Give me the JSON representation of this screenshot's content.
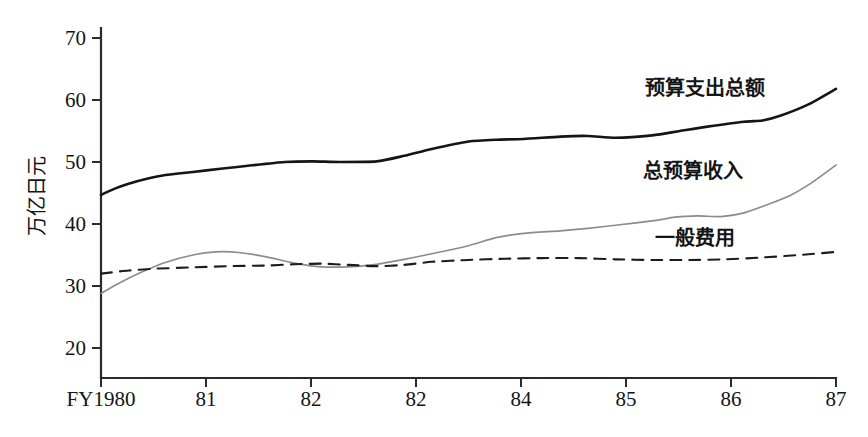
{
  "chart_data": {
    "type": "line",
    "title": "",
    "subtitle": "",
    "xlabel": "",
    "ylabel": "万亿日元",
    "ylim": [
      15,
      70
    ],
    "xlim": [
      1980,
      1987
    ],
    "grid": false,
    "legend_position": "inline-right",
    "x_tick_labels": [
      "FY1980",
      "81",
      "82",
      "82",
      "84",
      "85",
      "86",
      "87"
    ],
    "y_tick_labels": [
      "70",
      "60",
      "50",
      "40",
      "30",
      "20"
    ],
    "y_ticks": [
      70,
      60,
      50,
      40,
      30,
      20
    ],
    "x": [
      1980,
      1981,
      1982,
      1983,
      1984,
      1985,
      1986,
      1987
    ],
    "series": [
      {
        "name": "预算支出总额",
        "style": "solid",
        "color": "#151515",
        "width": 2.6,
        "values": [
          44.7,
          48.0,
          50.0,
          51.5,
          54.0,
          54.2,
          56.5,
          61.8
        ],
        "points": [
          [
            1980.0,
            44.7
          ],
          [
            1980.15,
            45.7
          ],
          [
            1980.3,
            46.5
          ],
          [
            1980.5,
            47.3
          ],
          [
            1980.7,
            47.9
          ],
          [
            1981.0,
            48.4
          ],
          [
            1981.3,
            48.9
          ],
          [
            1981.6,
            49.4
          ],
          [
            1982.0,
            50.0
          ],
          [
            1982.3,
            50.1
          ],
          [
            1982.6,
            50.0
          ],
          [
            1983.0,
            50.1
          ],
          [
            1983.3,
            51.0
          ],
          [
            1983.6,
            52.1
          ],
          [
            1984.0,
            53.3
          ],
          [
            1984.3,
            53.6
          ],
          [
            1984.6,
            53.7
          ],
          [
            1985.0,
            54.1
          ],
          [
            1985.3,
            54.2
          ],
          [
            1985.6,
            53.9
          ],
          [
            1986.0,
            54.3
          ],
          [
            1986.3,
            55.0
          ],
          [
            1986.6,
            55.7
          ],
          [
            1987.0,
            56.5
          ],
          [
            1987.2,
            56.7
          ],
          [
            1987.4,
            57.5
          ],
          [
            1987.7,
            59.3
          ],
          [
            1988.0,
            61.8
          ]
        ]
      },
      {
        "name": "总预算收入",
        "style": "solid",
        "color": "#8c8c8c",
        "width": 1.7,
        "values": [
          28.8,
          35.5,
          33.2,
          35.5,
          38.5,
          40.5,
          41.5,
          49.5
        ],
        "points": [
          [
            1980.0,
            28.8
          ],
          [
            1980.2,
            30.5
          ],
          [
            1980.45,
            32.3
          ],
          [
            1980.7,
            33.8
          ],
          [
            1981.0,
            35.0
          ],
          [
            1981.25,
            35.5
          ],
          [
            1981.5,
            35.4
          ],
          [
            1981.8,
            34.7
          ],
          [
            1982.1,
            33.7
          ],
          [
            1982.4,
            33.1
          ],
          [
            1982.7,
            33.1
          ],
          [
            1983.0,
            33.5
          ],
          [
            1983.3,
            34.3
          ],
          [
            1983.6,
            35.2
          ],
          [
            1984.0,
            36.5
          ],
          [
            1984.3,
            37.8
          ],
          [
            1984.6,
            38.5
          ],
          [
            1985.0,
            38.9
          ],
          [
            1985.3,
            39.3
          ],
          [
            1985.6,
            39.8
          ],
          [
            1986.0,
            40.5
          ],
          [
            1986.25,
            41.1
          ],
          [
            1986.5,
            41.3
          ],
          [
            1986.75,
            41.2
          ],
          [
            1987.0,
            41.8
          ],
          [
            1987.25,
            43.1
          ],
          [
            1987.5,
            44.6
          ],
          [
            1987.75,
            46.8
          ],
          [
            1988.0,
            49.5
          ]
        ]
      },
      {
        "name": "一般费用",
        "style": "dashed",
        "color": "#1c1c1c",
        "width": 2.1,
        "values": [
          32.0,
          32.8,
          33.3,
          33.4,
          34.2,
          34.4,
          34.3,
          35.5
        ],
        "points": [
          [
            1980.0,
            32.0
          ],
          [
            1980.3,
            32.5
          ],
          [
            1980.6,
            32.8
          ],
          [
            1981.0,
            33.0
          ],
          [
            1981.4,
            33.2
          ],
          [
            1981.8,
            33.3
          ],
          [
            1982.1,
            33.5
          ],
          [
            1982.4,
            33.6
          ],
          [
            1982.7,
            33.4
          ],
          [
            1983.0,
            33.2
          ],
          [
            1983.3,
            33.4
          ],
          [
            1983.6,
            33.9
          ],
          [
            1984.0,
            34.2
          ],
          [
            1984.4,
            34.4
          ],
          [
            1984.8,
            34.5
          ],
          [
            1985.2,
            34.5
          ],
          [
            1985.6,
            34.3
          ],
          [
            1986.0,
            34.2
          ],
          [
            1986.4,
            34.2
          ],
          [
            1986.8,
            34.3
          ],
          [
            1987.2,
            34.6
          ],
          [
            1987.6,
            35.0
          ],
          [
            1988.0,
            35.5
          ]
        ]
      }
    ],
    "annotations": [
      {
        "text": "预算支出总额",
        "x": 645,
        "y": 95
      },
      {
        "text": "总预算收入",
        "x": 643,
        "y": 178
      },
      {
        "text": "一般费用",
        "x": 655,
        "y": 245
      }
    ]
  }
}
